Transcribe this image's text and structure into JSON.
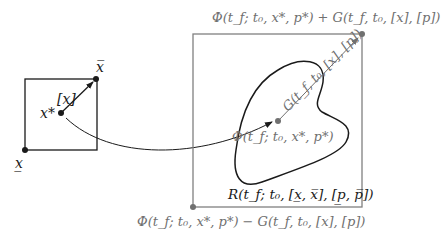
{
  "diagram": {
    "colors": {
      "dark": "#1a1a1a",
      "gray": "#707070",
      "box_gray": "#808080",
      "background": "#ffffff"
    },
    "left_box": {
      "label_upper": "x̅",
      "label_lower": "x̲",
      "label_interval": "[x]",
      "label_center": "x*"
    },
    "right_box": {
      "label_top": "Φ(t_f; t₀, x*, p*) + G(t_f, t₀, [x], [p])",
      "label_bottom": "Φ(t_f; t₀, x*, p*) − G(t_f, t₀, [x], [p])",
      "label_center": "Φ(t_f; t₀, x*, p*)",
      "label_arrow": "G(t_f, t₀, [x], [p])",
      "label_region": "R(t_f; t₀, [x̲, x̅], [p̲, p̅])"
    }
  }
}
